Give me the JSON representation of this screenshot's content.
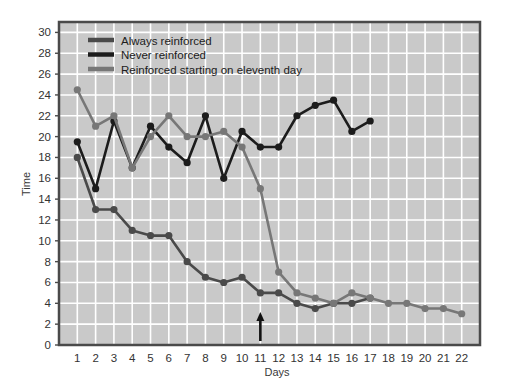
{
  "chart_data": {
    "type": "line",
    "title": "",
    "xlabel": "Days",
    "ylabel": "Time",
    "xlim": [
      0,
      23
    ],
    "ylim": [
      0,
      31
    ],
    "xticks": [
      1,
      2,
      3,
      4,
      5,
      6,
      7,
      8,
      9,
      10,
      11,
      12,
      13,
      14,
      15,
      16,
      17,
      18,
      19,
      20,
      21,
      22
    ],
    "yticks": [
      0,
      2,
      4,
      6,
      8,
      10,
      12,
      14,
      16,
      18,
      20,
      22,
      24,
      26,
      28,
      30
    ],
    "grid": true,
    "legend_position": "top-left",
    "plot_bg": "#c9c9c9",
    "grid_color": "#ffffff",
    "frame_color": "#4a4a4a",
    "annotations": [
      {
        "name": "arrow-day-11",
        "x": 11,
        "label": "",
        "description": "upward arrow at day 11"
      }
    ],
    "series": [
      {
        "name": "Always reinforced",
        "color": "#4a4a4a",
        "x": [
          1,
          2,
          3,
          4,
          5,
          6,
          7,
          8,
          9,
          10,
          11,
          12,
          13,
          14,
          15,
          16,
          17
        ],
        "values": [
          18,
          13,
          13,
          11,
          10.5,
          10.5,
          8,
          6.5,
          6,
          6.5,
          5,
          5,
          4,
          3.5,
          4,
          4,
          4.5
        ]
      },
      {
        "name": "Never reinforced",
        "color": "#1c1c1c",
        "x": [
          1,
          2,
          3,
          4,
          5,
          6,
          7,
          8,
          9,
          10,
          11,
          12,
          13,
          14,
          15,
          16,
          17
        ],
        "values": [
          19.5,
          15,
          21.5,
          17,
          21,
          19,
          17.5,
          22,
          16,
          20.5,
          19,
          19,
          22,
          23,
          23.5,
          20.5,
          21.5
        ]
      },
      {
        "name": "Reinforced starting on eleventh day",
        "color": "#777777",
        "x": [
          1,
          2,
          3,
          4,
          5,
          6,
          7,
          8,
          9,
          10,
          11,
          12,
          13,
          14,
          15,
          16,
          17,
          18,
          19,
          20,
          21,
          22
        ],
        "values": [
          24.5,
          21,
          22,
          17,
          20,
          22,
          20,
          20,
          20.5,
          19,
          15,
          7,
          5,
          4.5,
          4,
          5,
          4.5,
          4,
          4,
          3.5,
          3.5,
          3
        ]
      }
    ],
    "legend": [
      {
        "label": "Always reinforced",
        "color": "#4a4a4a"
      },
      {
        "label": "Never reinforced",
        "color": "#1c1c1c"
      },
      {
        "label": "Reinforced starting on eleventh day",
        "color": "#777777"
      }
    ]
  }
}
